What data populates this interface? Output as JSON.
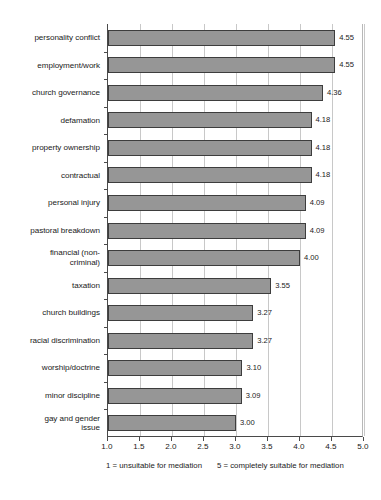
{
  "chart_data": {
    "type": "bar",
    "orientation": "horizontal",
    "title": "",
    "subtitle": "",
    "xlabel": "",
    "ylabel": "",
    "xlim": [
      1.0,
      5.0
    ],
    "grid": true,
    "legend": null,
    "categories": [
      "personality conflict",
      "employment/work",
      "church governance",
      "defamation",
      "property ownership",
      "contractual",
      "personal injury",
      "pastoral breakdown",
      "financial (non-criminal)",
      "taxation",
      "church buildings",
      "racial discrimination",
      "worship/doctrine",
      "minor discipline",
      "gay and gender issue"
    ],
    "category_lines": [
      [
        "personality conflict"
      ],
      [
        "employment/work"
      ],
      [
        "church governance"
      ],
      [
        "defamation"
      ],
      [
        "property ownership"
      ],
      [
        "contractual"
      ],
      [
        "personal injury"
      ],
      [
        "pastoral breakdown"
      ],
      [
        "financial (non-",
        "criminal)"
      ],
      [
        "taxation"
      ],
      [
        "church buildings"
      ],
      [
        "racial discrimination"
      ],
      [
        "worship/doctrine"
      ],
      [
        "minor discipline"
      ],
      [
        "gay and gender",
        "issue"
      ]
    ],
    "values": [
      4.55,
      4.55,
      4.36,
      4.18,
      4.18,
      4.18,
      4.09,
      4.09,
      4.0,
      3.55,
      3.27,
      3.27,
      3.1,
      3.09,
      3.0
    ],
    "value_labels": [
      "4.55",
      "4.55",
      "4.36",
      "4.18",
      "4.18",
      "4.18",
      "4.09",
      "4.09",
      "4.00",
      "3.55",
      "3.27",
      "3.27",
      "3.10",
      "3.09",
      "3.00"
    ],
    "xticks": [
      1.0,
      1.5,
      2.0,
      2.5,
      3.0,
      3.5,
      4.0,
      4.5,
      5.0
    ],
    "xtick_labels": [
      "1.0",
      "1.5",
      "2.0",
      "2.5",
      "3.0",
      "3.5",
      "4.0",
      "4.5",
      "5.0"
    ],
    "bar_color": "#969696",
    "bar_edge_color": "#3d3d3d",
    "grid_color": "#c8c8c8",
    "axis_color": "#4a4a4a",
    "text_color": "#1a1a1a"
  },
  "footnotes": {
    "low": "1 = unsuitable for mediation",
    "high": "5 = completely suitable for mediation"
  }
}
